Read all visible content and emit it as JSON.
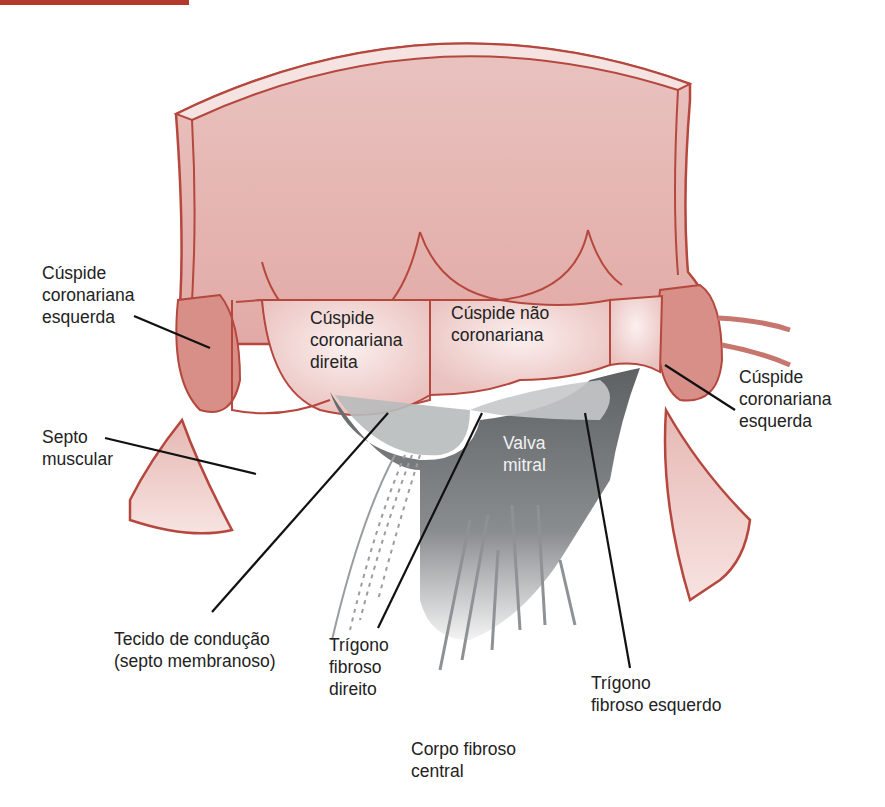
{
  "figure": {
    "colors": {
      "tissue": "#e8b8b4",
      "tissue_dark": "#c96f66",
      "outline": "#b5473e",
      "valve_gray": "#6e7174",
      "valve_light": "#c7cacc",
      "leader": "#111111",
      "page_bar": "#b33a2a"
    },
    "labels": {
      "left_coronary_cusp_left": "Cúspide\ncoronariana\nesquerda",
      "right_coronary_cusp": "Cúspide\ncoronariana\ndireita",
      "non_coronary_cusp": "Cúspide não\ncoronariana",
      "left_coronary_cusp_right": "Cúspide\ncoronariana\nesquerda",
      "muscular_septum": "Septo\nmuscular",
      "mitral_valve": "Valva\nmitral",
      "conduction_tissue": "Tecido de condução\n(septo membranoso)",
      "right_fibrous_trigone": "Trígono\nfibroso\ndireito",
      "left_fibrous_trigone": "Trígono\nfibroso esquerdo",
      "central_fibrous_body": "Corpo fibroso\ncentral"
    }
  }
}
